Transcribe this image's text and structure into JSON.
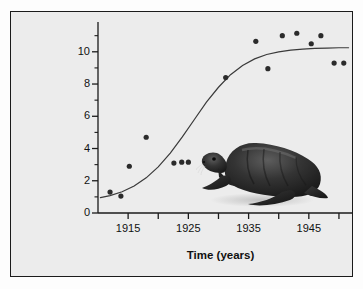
{
  "figure": {
    "background_color": "#ececec",
    "border_color": "#1b1b1b",
    "page_color": "#fdfdfd",
    "illustration": {
      "name": "fur-seal-illustration",
      "description": "Dark northern fur seal bull",
      "body_color": "#272727",
      "highlight_color": "#6a6a6a"
    }
  },
  "chart_data": {
    "type": "scatter",
    "title": "",
    "subtitle": "",
    "xlabel": "Time (years)",
    "ylabel": "Breeding male fur seals (thousands)",
    "xlim": [
      1910,
      1952
    ],
    "ylim": [
      0,
      11.6
    ],
    "grid": false,
    "legend": "none",
    "x_major_ticks": [
      1915,
      1925,
      1935,
      1945
    ],
    "x_major_tick_labels": [
      "1915",
      "1925",
      "1935",
      "1945"
    ],
    "x_minor_ticks": [
      1920,
      1930,
      1940,
      1950
    ],
    "y_major_ticks": [
      0,
      2,
      4,
      6,
      8,
      10
    ],
    "y_major_tick_labels": [
      "0",
      "2",
      "4",
      "6",
      "8",
      "10"
    ],
    "y_minor_ticks": [
      1,
      3,
      5,
      7,
      9,
      11
    ],
    "series": [
      {
        "name": "Breeding male fur seals",
        "type": "scatter",
        "marker": "circle",
        "marker_color": "#2b2b2b",
        "marker_size": 5.2,
        "points": [
          {
            "x": 1912.0,
            "y": 1.3
          },
          {
            "x": 1913.8,
            "y": 1.05
          },
          {
            "x": 1915.2,
            "y": 2.9
          },
          {
            "x": 1918.0,
            "y": 4.7
          },
          {
            "x": 1922.6,
            "y": 3.1
          },
          {
            "x": 1923.9,
            "y": 3.15
          },
          {
            "x": 1925.0,
            "y": 3.15
          },
          {
            "x": 1931.2,
            "y": 8.4
          },
          {
            "x": 1936.2,
            "y": 10.65
          },
          {
            "x": 1938.2,
            "y": 8.95
          },
          {
            "x": 1940.6,
            "y": 11.0
          },
          {
            "x": 1943.0,
            "y": 11.15
          },
          {
            "x": 1945.4,
            "y": 10.5
          },
          {
            "x": 1947.0,
            "y": 11.0
          },
          {
            "x": 1949.2,
            "y": 9.3
          },
          {
            "x": 1950.8,
            "y": 9.3
          }
        ]
      },
      {
        "name": "Fitted logistic growth curve",
        "type": "line",
        "line_color": "#3a3a3a",
        "line_width": 1.2,
        "asymptote": 10.25,
        "points": [
          {
            "x": 1910.4,
            "y": 0.95
          },
          {
            "x": 1912.0,
            "y": 1.08
          },
          {
            "x": 1914.0,
            "y": 1.32
          },
          {
            "x": 1916.0,
            "y": 1.68
          },
          {
            "x": 1918.0,
            "y": 2.18
          },
          {
            "x": 1920.0,
            "y": 2.86
          },
          {
            "x": 1922.0,
            "y": 3.72
          },
          {
            "x": 1924.0,
            "y": 4.72
          },
          {
            "x": 1926.0,
            "y": 5.8
          },
          {
            "x": 1928.0,
            "y": 6.88
          },
          {
            "x": 1930.0,
            "y": 7.8
          },
          {
            "x": 1932.0,
            "y": 8.58
          },
          {
            "x": 1934.0,
            "y": 9.15
          },
          {
            "x": 1936.0,
            "y": 9.56
          },
          {
            "x": 1938.0,
            "y": 9.83
          },
          {
            "x": 1940.0,
            "y": 10.0
          },
          {
            "x": 1942.0,
            "y": 10.1
          },
          {
            "x": 1944.0,
            "y": 10.17
          },
          {
            "x": 1946.0,
            "y": 10.21
          },
          {
            "x": 1948.0,
            "y": 10.23
          },
          {
            "x": 1950.0,
            "y": 10.25
          },
          {
            "x": 1951.6,
            "y": 10.25
          }
        ]
      }
    ]
  }
}
